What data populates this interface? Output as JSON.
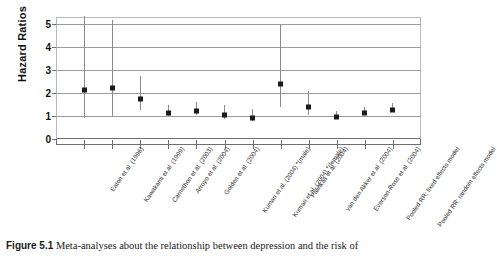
{
  "caption": {
    "label": "Figure 5.1",
    "text": "Meta-analyses about the relationship between depression and the risk of"
  },
  "chart_data": {
    "type": "scatter",
    "title": "",
    "xlabel": "",
    "ylabel": "Hazard Ratios",
    "ylim": [
      0,
      5.3
    ],
    "yticks": [
      0,
      1,
      2,
      3,
      4,
      5
    ],
    "ytick_labels": [
      "0",
      "1",
      "2",
      "3",
      "4",
      "5"
    ],
    "grid": true,
    "legend": "none",
    "error_bars": "95% confidence interval",
    "categories": [
      "Eaton et al. (1996)",
      "Kawakami et al. (1999)",
      "Carnethon et al. (2003)",
      "Arroyo et al. (2004)",
      "Golden et al. (2004)",
      "Kumari et al. (2004) *(male)",
      "Kumari et al. (2004) *(female)",
      "Palinkas et al. (2004)",
      "van den Akker et al. (2004)",
      "Everson-Rose et al. (2004)",
      "Pooled RR: fixed effects model",
      "Pooled RR: random effects model"
    ],
    "values": [
      2.23,
      2.31,
      1.86,
      1.22,
      1.32,
      1.17,
      1.01,
      2.5,
      1.5,
      1.05,
      1.25,
      1.35
    ],
    "ci_low": [
      0.9,
      1.0,
      1.25,
      1.0,
      1.05,
      0.86,
      0.8,
      1.4,
      1.05,
      0.9,
      1.12,
      1.15
    ],
    "ci_high": [
      5.35,
      5.18,
      2.75,
      1.47,
      1.6,
      1.5,
      1.3,
      4.95,
      2.1,
      1.22,
      1.38,
      1.58
    ]
  },
  "axis": {
    "y_title": "Hazard Ratios"
  }
}
